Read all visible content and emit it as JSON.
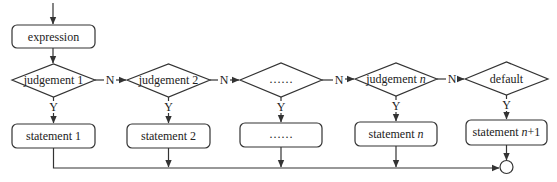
{
  "diagram": {
    "type": "switch-case flowchart",
    "start": {
      "label": "expression"
    },
    "judgements": [
      {
        "label": "judgement 1",
        "italic_part": ""
      },
      {
        "label": "judgement 2",
        "italic_part": ""
      },
      {
        "label": "……",
        "italic_part": ""
      },
      {
        "label": "judgement ",
        "italic_part": "n"
      },
      {
        "label": "default",
        "italic_part": ""
      }
    ],
    "statements": [
      {
        "label": "statement 1",
        "italic_part": "",
        "suffix": ""
      },
      {
        "label": "statement 2",
        "italic_part": "",
        "suffix": ""
      },
      {
        "label": "……",
        "italic_part": "",
        "suffix": ""
      },
      {
        "label": "statement ",
        "italic_part": "n",
        "suffix": ""
      },
      {
        "label": "statement ",
        "italic_part": "n",
        "suffix": "+1"
      }
    ],
    "edge_labels": {
      "no": "N",
      "yes": "Y"
    },
    "end_node": "merge-circle",
    "colors": {
      "stroke": "#333333",
      "fill": "#ffffff",
      "text": "#222222"
    }
  }
}
